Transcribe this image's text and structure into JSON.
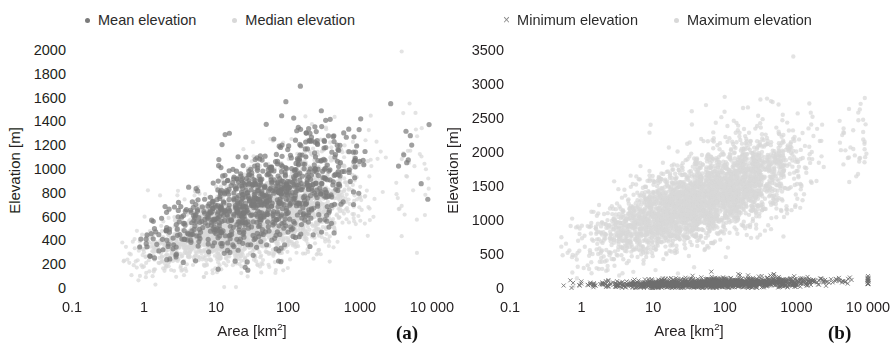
{
  "figure": {
    "panels": [
      {
        "tag": "(a)",
        "legend": [
          {
            "label": "Mean elevation",
            "marker": "dot",
            "color": "#7b7b7b"
          },
          {
            "label": "Median elevation",
            "marker": "dot",
            "color": "#d8d8d8"
          }
        ],
        "chart_data": {
          "type": "scatter",
          "title": "",
          "xlabel": "Area [km2]",
          "ylabel": "Elevation [m]",
          "xscale": "log",
          "xlim": [
            0.1,
            10000
          ],
          "ylim": [
            0,
            2000
          ],
          "xticks": [
            0.1,
            1,
            10,
            100,
            1000,
            10000
          ],
          "xticklabels": [
            "0.1",
            "1",
            "10",
            "100",
            "1000",
            "10 000"
          ],
          "yticks": [
            0,
            200,
            400,
            600,
            800,
            1000,
            1200,
            1400,
            1600,
            1800,
            2000
          ],
          "yticklabels": [
            "0",
            "200",
            "400",
            "600",
            "800",
            "1000",
            "1200",
            "1400",
            "1600",
            "1800",
            "2000"
          ],
          "grid": false,
          "legend_position": "above-center",
          "series": [
            {
              "name": "Median elevation",
              "color": "#d8d8d8",
              "marker": "circle",
              "size": 4.2,
              "n_points": 2600,
              "seed": 17,
              "description": "Dense light-gray cloud, lower envelope of the fan; rises from ~100 m at 0.2 km2 to ~1000 m near 500 km2",
              "trend": {
                "x_log_range": [
                  -0.6,
                  3.5
                ],
                "y_at_xmin": 160,
                "y_at_xmax": 900,
                "spread_at_xmin": 130,
                "spread_at_xmax": 430
              }
            },
            {
              "name": "Mean elevation",
              "color": "#7b7b7b",
              "marker": "circle",
              "size": 5.2,
              "n_points": 900,
              "seed": 42,
              "description": "Medium-gray cloud overlying median cloud, fanning upward to ~1700 m near 300 km2, isolated points out to 4000 km2",
              "trend": {
                "x_log_range": [
                  -0.5,
                  3.6
                ],
                "y_at_xmin": 260,
                "y_at_xmax": 1150,
                "spread_at_xmin": 180,
                "spread_at_xmax": 480
              }
            }
          ]
        }
      },
      {
        "tag": "(b)",
        "legend": [
          {
            "label": "Minimum elevation",
            "marker": "cross",
            "color": "#8a8a8a"
          },
          {
            "label": "Maximum elevation",
            "marker": "dot",
            "color": "#d8d8d8"
          }
        ],
        "chart_data": {
          "type": "scatter",
          "title": "",
          "xlabel": "Area [km2]",
          "ylabel": "Elevation [m]",
          "xscale": "log",
          "xlim": [
            0.1,
            10000
          ],
          "ylim": [
            0,
            3500
          ],
          "xticks": [
            0.1,
            1,
            10,
            100,
            1000,
            10000
          ],
          "xticklabels": [
            "0.1",
            "1",
            "10",
            "100",
            "1000",
            "10 000"
          ],
          "yticks": [
            0,
            500,
            1000,
            1500,
            2000,
            2500,
            3000,
            3500
          ],
          "yticklabels": [
            "0",
            "500",
            "1000",
            "1500",
            "2000",
            "2500",
            "3000",
            "3500"
          ],
          "grid": false,
          "legend_position": "above-center",
          "series": [
            {
              "name": "Maximum elevation",
              "color": "#d8d8d8",
              "marker": "circle",
              "size": 4.4,
              "n_points": 3400,
              "seed": 7,
              "description": "Broad light-gray cloud rising from ~200 m at 0.3 km2 up to ~2300 m near 1000 km2, sparse outliers to ~3100 m",
              "trend": {
                "x_log_range": [
                  -0.5,
                  3.6
                ],
                "y_at_xmin": 380,
                "y_at_xmax": 2050,
                "spread_at_xmin": 330,
                "spread_at_xmax": 620
              }
            },
            {
              "name": "Minimum elevation",
              "color": "#6d6d6d",
              "marker": "cross",
              "size": 4.0,
              "n_points": 1500,
              "seed": 99,
              "description": "Dark x markers forming a dense band hugging the baseline near 0-120 m across the whole area range",
              "trend": {
                "x_log_range": [
                  -0.5,
                  4.0
                ],
                "y_at_xmin": 30,
                "y_at_xmax": 95,
                "spread_at_xmin": 40,
                "spread_at_xmax": 70
              }
            }
          ]
        }
      }
    ]
  }
}
